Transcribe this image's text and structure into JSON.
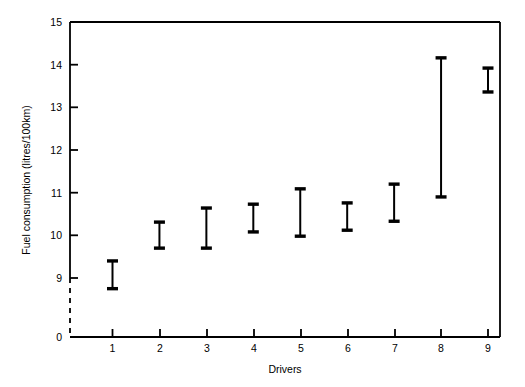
{
  "chart_data": {
    "type": "error_bar",
    "title": "",
    "xlabel": "Drivers",
    "ylabel": "Fuel consumption (litres/100km)",
    "categories": [
      "1",
      "2",
      "3",
      "4",
      "5",
      "6",
      "7",
      "8",
      "9"
    ],
    "x_ticks": [
      "1",
      "2",
      "3",
      "4",
      "5",
      "6",
      "7",
      "8",
      "9"
    ],
    "y_ticks": [
      "0",
      "9",
      "10",
      "11",
      "12",
      "13",
      "14",
      "15"
    ],
    "ylim": [
      9,
      15
    ],
    "y_axis_break": true,
    "y_axis_break_note": "dashed segment between 0 and 9",
    "grid": false,
    "legend": null,
    "series": [
      {
        "name": "Fuel consumption range",
        "marker": "capped-vertical-bar",
        "color": "#000000",
        "points": [
          {
            "x": "1",
            "low": 8.75,
            "high": 9.4
          },
          {
            "x": "2",
            "low": 9.7,
            "high": 10.31
          },
          {
            "x": "3",
            "low": 9.7,
            "high": 10.64
          },
          {
            "x": "4",
            "low": 10.08,
            "high": 10.73
          },
          {
            "x": "5",
            "low": 9.98,
            "high": 11.09
          },
          {
            "x": "6",
            "low": 10.12,
            "high": 10.76
          },
          {
            "x": "7",
            "low": 10.33,
            "high": 11.2
          },
          {
            "x": "8",
            "low": 10.9,
            "high": 14.16
          },
          {
            "x": "9",
            "low": 13.36,
            "high": 13.92
          }
        ]
      }
    ]
  },
  "colors": {
    "ink": "#000000",
    "background": "#ffffff"
  }
}
